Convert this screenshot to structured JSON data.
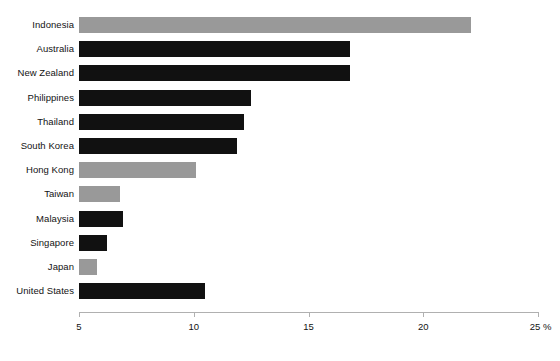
{
  "chart_data": {
    "type": "bar",
    "orientation": "horizontal",
    "title": "",
    "subtitle": "",
    "xlabel": "",
    "ylabel": "",
    "unit": "%",
    "xlim": [
      5,
      25
    ],
    "xticks": [
      5,
      10,
      15,
      20,
      25
    ],
    "xtick_labels": [
      "5",
      "10",
      "15",
      "20",
      "25 %"
    ],
    "grid": false,
    "legend": "none",
    "colors": {
      "dark": "#111111",
      "light": "#999999",
      "axis": "#b0b0b0",
      "text": "#131313",
      "background": "#ffffff"
    },
    "categories": [
      "Indonesia",
      "Australia",
      "New Zealand",
      "Philippines",
      "Thailand",
      "South Korea",
      "Hong Kong",
      "Taiwan",
      "Malaysia",
      "Singapore",
      "Japan",
      "United States"
    ],
    "values": [
      22.1,
      16.8,
      16.8,
      12.5,
      12.2,
      11.9,
      10.1,
      6.8,
      6.9,
      6.2,
      5.8,
      10.5
    ],
    "bar_shades": [
      "light",
      "dark",
      "dark",
      "dark",
      "dark",
      "dark",
      "light",
      "light",
      "dark",
      "dark",
      "light",
      "dark"
    ]
  }
}
